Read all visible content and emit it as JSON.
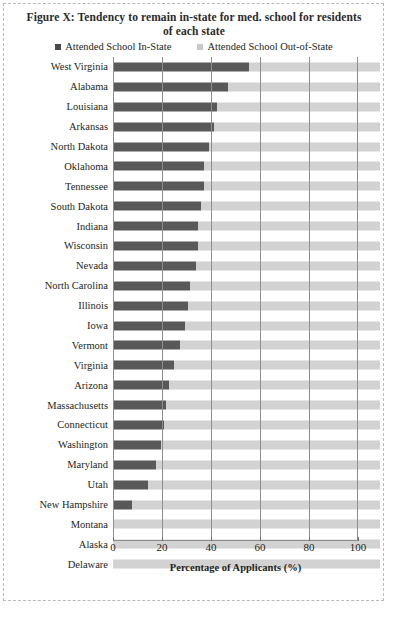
{
  "figure": {
    "title": "Figure X: Tendency to remain in-state for med. school for residents of each state",
    "legend": [
      {
        "label": "Attended School In-State",
        "color": "#595959",
        "key": "in_state"
      },
      {
        "label": "Attended School Out-of-State",
        "color": "#d2d2d2",
        "key": "out_of_state"
      }
    ],
    "xlabel": "Percentage of Applicants (%)"
  },
  "chart_data": {
    "type": "bar",
    "orientation": "horizontal",
    "stacked": true,
    "title": "Figure X: Tendency to remain in-state for med. school for residents of each state",
    "xlabel": "Percentage of Applicants (%)",
    "ylabel": "",
    "xlim": [
      0,
      100
    ],
    "xticks": [
      0,
      20,
      40,
      60,
      80,
      100
    ],
    "grid": true,
    "legend_position": "top",
    "categories": [
      "West Virginia",
      "Alabama",
      "Louisiana",
      "Arkansas",
      "North Dakota",
      "Oklahoma",
      "Tennessee",
      "South Dakota",
      "Indiana",
      "Wisconsin",
      "Nevada",
      "North Carolina",
      "Illinois",
      "Iowa",
      "Vermont",
      "Virginia",
      "Arizona",
      "Massachusetts",
      "Connecticut",
      "Washington",
      "Maryland",
      "Utah",
      "New Hampshire",
      "Montana",
      "Alaska",
      "Delaware"
    ],
    "series": [
      {
        "name": "Attended School In-State",
        "color": "#595959",
        "values": [
          51,
          43,
          39,
          38,
          36,
          34,
          34,
          33,
          32,
          32,
          31,
          29,
          28,
          27,
          25,
          23,
          21,
          20,
          19,
          18,
          16,
          13,
          7,
          0,
          0,
          0
        ]
      },
      {
        "name": "Attended School Out-of-State",
        "color": "#d2d2d2",
        "values": [
          49,
          57,
          61,
          62,
          64,
          66,
          66,
          67,
          68,
          68,
          69,
          71,
          72,
          73,
          75,
          77,
          79,
          80,
          81,
          82,
          84,
          87,
          93,
          100,
          100,
          100
        ]
      }
    ],
    "rows": [
      {
        "state": "West Virginia",
        "in_state": 51,
        "out_of_state": 49
      },
      {
        "state": "Alabama",
        "in_state": 43,
        "out_of_state": 57
      },
      {
        "state": "Louisiana",
        "in_state": 39,
        "out_of_state": 61
      },
      {
        "state": "Arkansas",
        "in_state": 38,
        "out_of_state": 62
      },
      {
        "state": "North Dakota",
        "in_state": 36,
        "out_of_state": 64
      },
      {
        "state": "Oklahoma",
        "in_state": 34,
        "out_of_state": 66
      },
      {
        "state": "Tennessee",
        "in_state": 34,
        "out_of_state": 66
      },
      {
        "state": "South Dakota",
        "in_state": 33,
        "out_of_state": 67
      },
      {
        "state": "Indiana",
        "in_state": 32,
        "out_of_state": 68
      },
      {
        "state": "Wisconsin",
        "in_state": 32,
        "out_of_state": 68
      },
      {
        "state": "Nevada",
        "in_state": 31,
        "out_of_state": 69
      },
      {
        "state": "North Carolina",
        "in_state": 29,
        "out_of_state": 71
      },
      {
        "state": "Illinois",
        "in_state": 28,
        "out_of_state": 72
      },
      {
        "state": "Iowa",
        "in_state": 27,
        "out_of_state": 73
      },
      {
        "state": "Vermont",
        "in_state": 25,
        "out_of_state": 75
      },
      {
        "state": "Virginia",
        "in_state": 23,
        "out_of_state": 77
      },
      {
        "state": "Arizona",
        "in_state": 21,
        "out_of_state": 79
      },
      {
        "state": "Massachusetts",
        "in_state": 20,
        "out_of_state": 80
      },
      {
        "state": "Connecticut",
        "in_state": 19,
        "out_of_state": 81
      },
      {
        "state": "Washington",
        "in_state": 18,
        "out_of_state": 82
      },
      {
        "state": "Maryland",
        "in_state": 16,
        "out_of_state": 84
      },
      {
        "state": "Utah",
        "in_state": 13,
        "out_of_state": 87
      },
      {
        "state": "New Hampshire",
        "in_state": 7,
        "out_of_state": 93
      },
      {
        "state": "Montana",
        "in_state": 0,
        "out_of_state": 100
      },
      {
        "state": "Alaska",
        "in_state": 0,
        "out_of_state": 100
      },
      {
        "state": "Delaware",
        "in_state": 0,
        "out_of_state": 100
      }
    ]
  }
}
